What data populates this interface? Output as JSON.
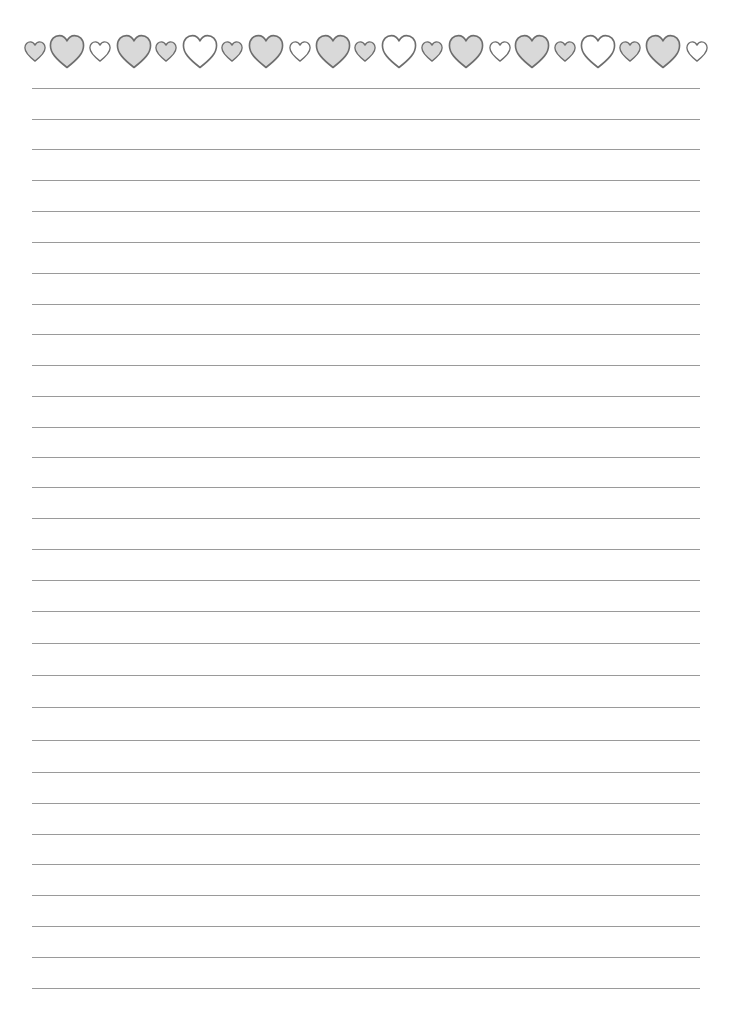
{
  "page": {
    "type": "lined-writing-paper",
    "background": "#ffffff"
  },
  "colors": {
    "heart_fill_gray": "#d9d9d9",
    "heart_fill_white": "#ffffff",
    "heart_stroke": "#6e6e6e",
    "rule_line": "#9a9a9a"
  },
  "heart_border": {
    "hearts": [
      {
        "x": 24,
        "size": "small",
        "fill": "gray"
      },
      {
        "x": 49,
        "size": "large",
        "fill": "gray"
      },
      {
        "x": 89,
        "size": "small",
        "fill": "white"
      },
      {
        "x": 116,
        "size": "large",
        "fill": "gray"
      },
      {
        "x": 155,
        "size": "small",
        "fill": "gray"
      },
      {
        "x": 182,
        "size": "large",
        "fill": "white"
      },
      {
        "x": 221,
        "size": "small",
        "fill": "gray"
      },
      {
        "x": 248,
        "size": "large",
        "fill": "gray"
      },
      {
        "x": 289,
        "size": "small",
        "fill": "white"
      },
      {
        "x": 315,
        "size": "large",
        "fill": "gray"
      },
      {
        "x": 354,
        "size": "small",
        "fill": "gray"
      },
      {
        "x": 381,
        "size": "large",
        "fill": "white"
      },
      {
        "x": 421,
        "size": "small",
        "fill": "gray"
      },
      {
        "x": 448,
        "size": "large",
        "fill": "gray"
      },
      {
        "x": 489,
        "size": "small",
        "fill": "white"
      },
      {
        "x": 514,
        "size": "large",
        "fill": "gray"
      },
      {
        "x": 554,
        "size": "small",
        "fill": "gray"
      },
      {
        "x": 580,
        "size": "large",
        "fill": "white"
      },
      {
        "x": 619,
        "size": "small",
        "fill": "gray"
      },
      {
        "x": 645,
        "size": "large",
        "fill": "gray"
      },
      {
        "x": 686,
        "size": "small",
        "fill": "white"
      }
    ]
  },
  "ruled_lines": {
    "left": 32,
    "right": 700,
    "y_positions": [
      88,
      119,
      149,
      180,
      211,
      242,
      273,
      304,
      334,
      365,
      396,
      427,
      457,
      487,
      518,
      549,
      580,
      611,
      643,
      675,
      707,
      740,
      772,
      803,
      834,
      864,
      895,
      926,
      957,
      988
    ]
  }
}
